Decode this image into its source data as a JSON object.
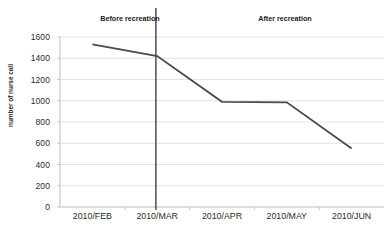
{
  "chart_data": {
    "type": "line",
    "title": "",
    "xlabel": "",
    "ylabel": "number of nurse call",
    "categories": [
      "2010/FEB",
      "2010/MAR",
      "2010/APR",
      "2010/MAY",
      "2010/JUN"
    ],
    "values": [
      1530,
      1420,
      990,
      985,
      550
    ],
    "series": [
      {
        "name": "number of nurse call",
        "values": [
          1530,
          1420,
          990,
          985,
          550
        ]
      }
    ],
    "ylim": [
      0,
      1600
    ],
    "yticks": [
      0,
      200,
      400,
      600,
      800,
      1000,
      1200,
      1400,
      1600
    ],
    "ytick_labels": [
      "0",
      "200",
      "400",
      "600",
      "800",
      "1000",
      "1200",
      "1400",
      "1600"
    ],
    "grid": true,
    "grid_axis": "y",
    "legend": false,
    "legend_position": "none",
    "line_color": "#4a4a4a",
    "grid_color": "#dcdcdc",
    "axis_color": "#bdbdbd",
    "text_color": "#2b2b2b",
    "annotations": [
      {
        "id": "before-recreation",
        "text": "Before recreation",
        "x_category_span": [
          "2010/FEB",
          "2010/MAR"
        ]
      },
      {
        "id": "after-recreation",
        "text": "After recreation",
        "x_category_span": [
          "2010/APR",
          "2010/JUN"
        ]
      },
      {
        "id": "recreation-divider",
        "text": "",
        "type": "vertical-line",
        "color": "#404040",
        "between_categories": [
          "2010/MAR",
          "2010/APR"
        ]
      }
    ]
  },
  "axis": {
    "y_title": "number of nurse call",
    "y_tick_labels": [
      "1600",
      "1400",
      "1200",
      "1000",
      "800",
      "600",
      "400",
      "200",
      "0"
    ],
    "x_tick_labels": [
      "2010/FEB",
      "2010/MAR",
      "2010/APR",
      "2010/MAY",
      "2010/JUN"
    ]
  },
  "annotations": {
    "before": "Before recreation",
    "after": "After recreation"
  }
}
